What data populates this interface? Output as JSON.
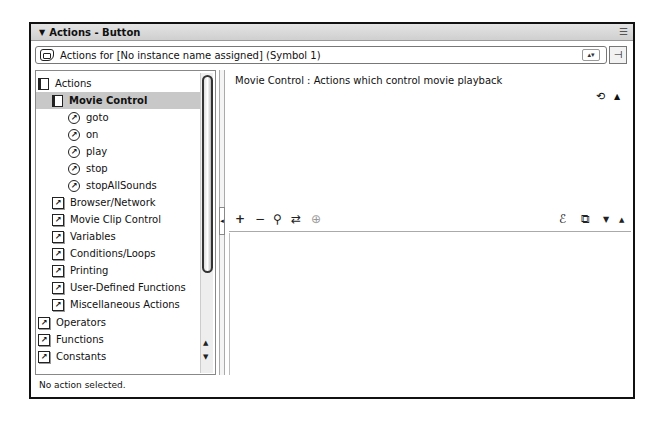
{
  "panel": {
    "title": "Actions - Button",
    "collapse_arrow": "▼",
    "options_icon": "☰"
  },
  "actions_for": {
    "label": "Actions for [No instance name assigned]  (Symbol 1)",
    "dropdown_glyph": "▴▾",
    "pin_glyph": "⊣"
  },
  "toolbox": {
    "items": [
      {
        "label": "Actions",
        "icon": "book-icon",
        "level": 0
      },
      {
        "label": "Movie Control",
        "icon": "book-icon",
        "level": 1,
        "selected": true
      },
      {
        "label": "goto",
        "icon": "action-circle-icon",
        "level": 2
      },
      {
        "label": "on",
        "icon": "action-circle-icon",
        "level": 2
      },
      {
        "label": "play",
        "icon": "action-circle-icon",
        "level": 2
      },
      {
        "label": "stop",
        "icon": "action-circle-icon",
        "level": 2
      },
      {
        "label": "stopAllSounds",
        "icon": "action-circle-icon",
        "level": 2
      },
      {
        "label": "Browser/Network",
        "icon": "category-box-icon",
        "level": 1
      },
      {
        "label": "Movie Clip Control",
        "icon": "category-box-icon",
        "level": 1
      },
      {
        "label": "Variables",
        "icon": "category-box-icon",
        "level": 1
      },
      {
        "label": "Conditions/Loops",
        "icon": "category-box-icon",
        "level": 1
      },
      {
        "label": "Printing",
        "icon": "category-box-icon",
        "level": 1
      },
      {
        "label": "User-Defined Functions",
        "icon": "category-box-icon",
        "level": 1
      },
      {
        "label": "Miscellaneous Actions",
        "icon": "category-box-icon",
        "level": 1
      },
      {
        "label": "Operators",
        "icon": "category-box-icon",
        "level": 0
      },
      {
        "label": "Functions",
        "icon": "category-box-icon",
        "level": 0
      },
      {
        "label": "Constants",
        "icon": "category-box-icon",
        "level": 0
      }
    ],
    "circle_glyph": "↗",
    "box_glyph": "↗",
    "scroll_up": "▲",
    "scroll_down": "▼"
  },
  "splitter": {
    "glyph": "◂"
  },
  "description": {
    "text": "Movie Control : Actions which control movie playback",
    "ref_glyph": "⟲",
    "collapse_glyph": "▲"
  },
  "script_toolbar": {
    "add": "+",
    "remove": "−",
    "find": "⚲",
    "replace": "⇄",
    "target": "⊕",
    "debug": "ℰ",
    "view_options": "⧉",
    "move_down": "▼",
    "move_up": "▲"
  },
  "status": {
    "text": "No action selected."
  }
}
